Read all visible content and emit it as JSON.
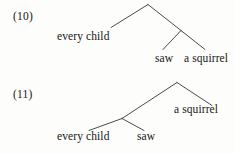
{
  "page": {
    "background_color": "#fdfdfb",
    "ink_color": "#161616",
    "line_color": "#2b2b2b"
  },
  "examples": [
    {
      "number": "(10)",
      "tree": {
        "leaves": [
          {
            "text": "every child"
          },
          {
            "text": "saw"
          },
          {
            "text": "a squirrel"
          }
        ],
        "description": "right-branching tree: root dominates 'every child' and a node dominating 'saw' and 'a squirrel'"
      }
    },
    {
      "number": "(11)",
      "tree": {
        "leaves": [
          {
            "text": "a squirrel"
          },
          {
            "text": "every child"
          },
          {
            "text": "saw"
          }
        ],
        "description": "left-branching tree: root dominates a node dominating 'every child' and 'saw', plus 'a squirrel'"
      }
    }
  ]
}
